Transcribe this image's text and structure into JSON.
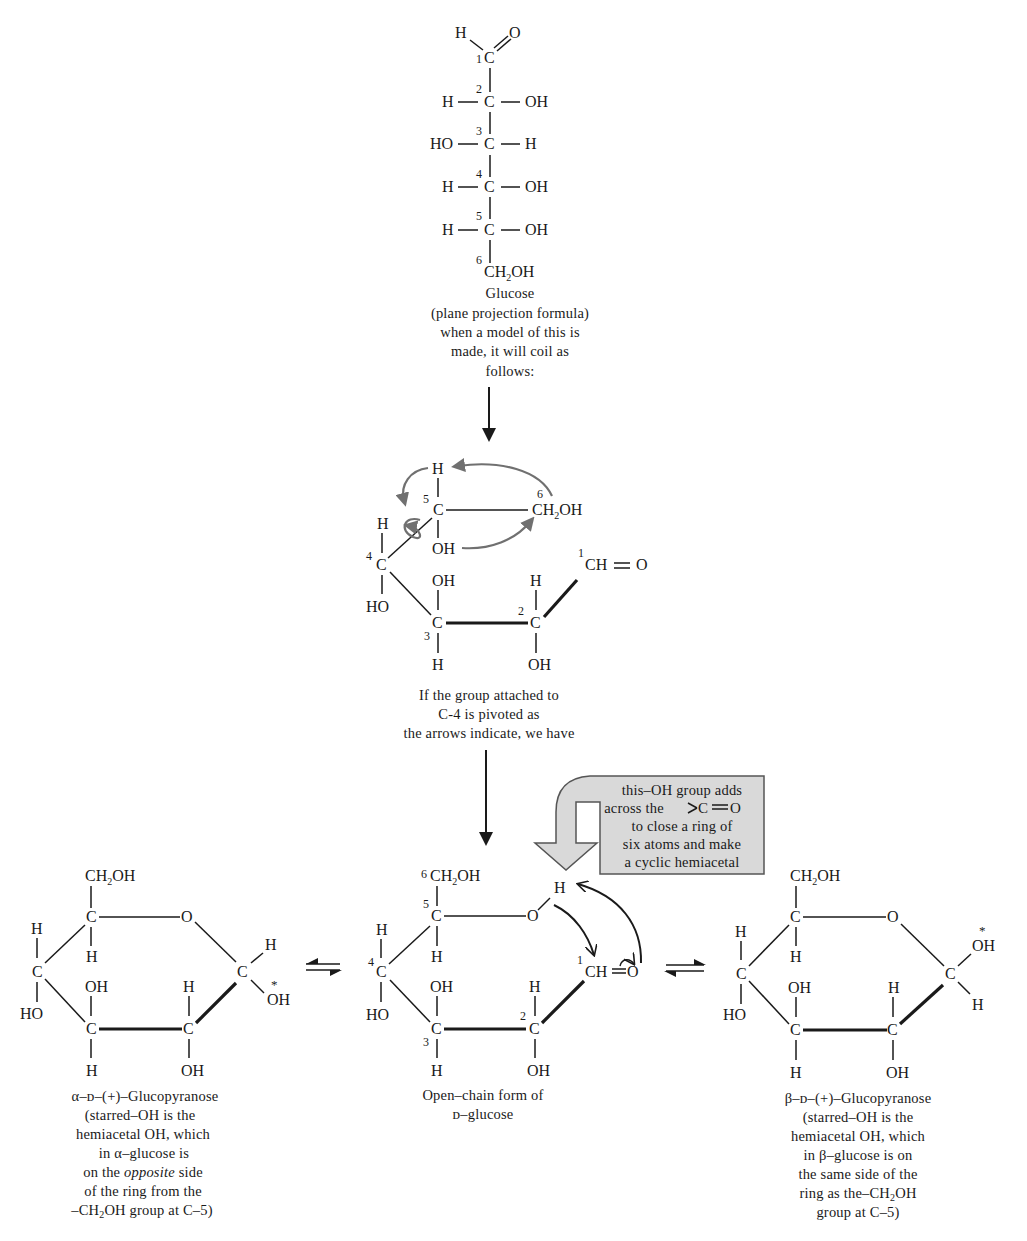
{
  "figure": {
    "fischer": {
      "name": "Glucose",
      "top": {
        "H": "H",
        "O": "O"
      },
      "carbons": [
        {
          "num": "1",
          "left": "",
          "right": ""
        },
        {
          "num": "2",
          "left": "H",
          "right": "OH"
        },
        {
          "num": "3",
          "left": "HO",
          "right": "H"
        },
        {
          "num": "4",
          "left": "H",
          "right": "OH"
        },
        {
          "num": "5",
          "left": "H",
          "right": "OH"
        }
      ],
      "c6": {
        "num": "6",
        "label": "CH",
        "sub": "2",
        "tail": "OH"
      },
      "atom_c": "C",
      "caption": [
        "Glucose",
        "(plane projection formula)",
        "when a model of this is",
        "made, it will coil as",
        "follows:"
      ]
    },
    "coiled": {
      "labels": {
        "h_top": "H",
        "c5": "C",
        "c5_num": "5",
        "ch2oh_num": "6",
        "ch2oh": "CH",
        "ch2oh_sub": "2",
        "ch2oh_tail": "OH",
        "oh5": "OH",
        "h4": "H",
        "c4": "C",
        "c4_num": "4",
        "ho4": "HO",
        "oh3": "OH",
        "c3": "C",
        "c3_num": "3",
        "h3": "H",
        "h2": "H",
        "c2": "C",
        "c2_num": "2",
        "oh2": "OH",
        "c1_num": "1",
        "cho": "CH",
        "eq": "=",
        "o": "O"
      },
      "caption": [
        "If the group attached to",
        "C-4 is pivoted as",
        "the arrows indicate, we have"
      ]
    },
    "callout": {
      "lines": [
        "this–OH group adds",
        "across the",
        "to close a ring of",
        "six atoms and make",
        "a cyclic hemiacetal"
      ],
      "carbonyl": "C═O",
      "fill": "#d9d9d9",
      "stroke": "#555555"
    },
    "open_chain": {
      "labels": {
        "c6_num": "6",
        "ch2oh": "CH",
        "sub": "2",
        "tail": "OH",
        "c5_num": "5",
        "c5": "C",
        "o": "O",
        "h_o": "H",
        "h5": "H",
        "h4": "H",
        "c4_num": "4",
        "c4": "C",
        "ho4": "HO",
        "oh3": "OH",
        "c3": "C",
        "c3_num": "3",
        "h3": "H",
        "h2": "H",
        "c2_num": "2",
        "c2": "C",
        "oh2": "OH",
        "c1_num": "1",
        "ch": "CH",
        "o1": "O"
      },
      "caption": [
        "Open–chain form of",
        "ᴅ–glucose"
      ]
    },
    "alpha": {
      "labels": {
        "ch2oh": "CH",
        "sub": "2",
        "tail": "OH",
        "c5": "C",
        "o": "O",
        "h5": "H",
        "h4": "H",
        "c4": "C",
        "ho4": "HO",
        "oh3": "OH",
        "c3": "C",
        "h3": "H",
        "h2": "H",
        "c2": "C",
        "oh2": "OH",
        "c1": "C",
        "h1": "H",
        "oh1": "OH",
        "star": "*"
      },
      "caption": [
        "α–ᴅ–(+)–Glucopyranose",
        "(starred–OH is the",
        "hemiacetal OH, which",
        "in α–glucose is",
        "on the",
        "opposite",
        "side",
        "of the ring from the",
        "–CH",
        "2",
        "OH group at C–5)"
      ]
    },
    "beta": {
      "labels": {
        "ch2oh": "CH",
        "sub": "2",
        "tail": "OH",
        "c5": "C",
        "o": "O",
        "h5": "H",
        "h4": "H",
        "c4": "C",
        "ho4": "HO",
        "oh3": "OH",
        "c3": "C",
        "h3": "H",
        "h2": "H",
        "c2": "C",
        "oh2": "OH",
        "c1": "C",
        "h1": "H",
        "oh1": "OH",
        "star": "*"
      },
      "caption": [
        "β–ᴅ–(+)–Glucopyranose",
        "(starred–OH is the",
        "hemiacetal OH, which",
        "in β–glucose is on",
        "the same side of the",
        "ring as the–CH",
        "2",
        "OH",
        "group at C–5)"
      ]
    },
    "equilibrium_arrows": [
      "left-equilibrium-arrow",
      "right-equilibrium-arrow"
    ],
    "flow_arrows": [
      "down-arrow-1",
      "down-arrow-2"
    ]
  }
}
